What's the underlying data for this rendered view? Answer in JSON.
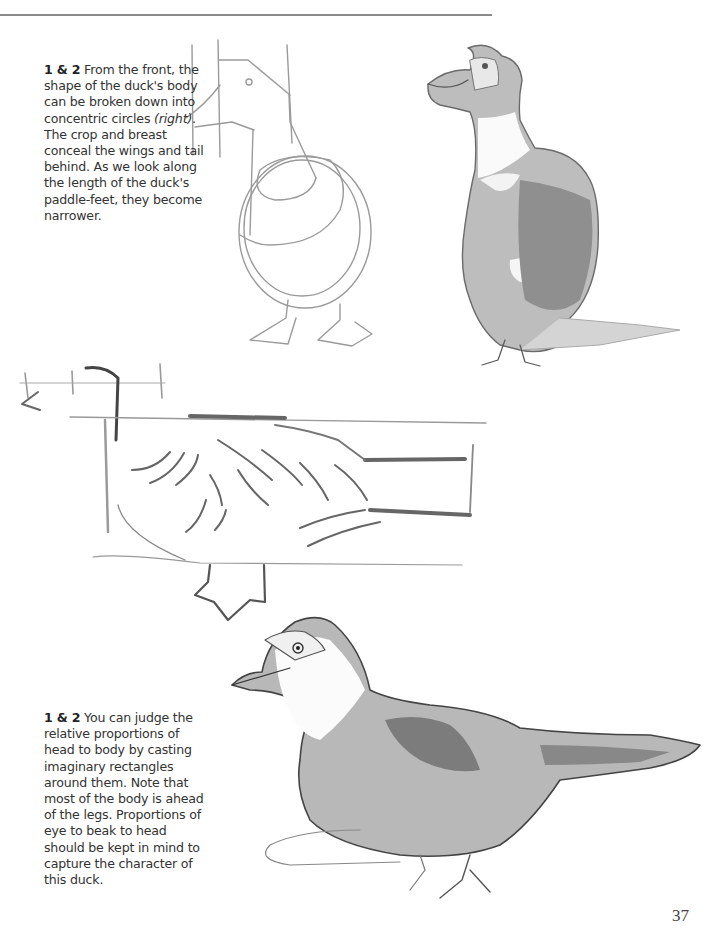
{
  "page": {
    "page_number": "37",
    "rule_color": "#8a8a8a"
  },
  "captions": [
    {
      "label": "1 & 2",
      "text_before_italic": " From the front, the shape of the duck's body can be broken down into concentric circles ",
      "italic": "(right)",
      "text_after_italic": ". The crop and breast conceal the wings and tail behind. As we look along the length of the duck's paddle-feet, they become narrower."
    },
    {
      "label": "1 & 2",
      "text": " You can judge the relative proportions of head to body by casting imaginary rectangles around them. Note that most of the body is ahead of the legs. Proportions of eye to beak to head should be kept in mind to capture the character of this duck."
    }
  ],
  "illustrations": [
    {
      "name": "front-construction-sketch",
      "description": "Front view of duck built from concentric circles and guide lines"
    },
    {
      "name": "front-finished-duck",
      "description": "Shaded pencil drawing of Muscovy duck, front view"
    },
    {
      "name": "side-rectangle-sketch",
      "description": "Side view of duck constructed with imaginary rectangles"
    },
    {
      "name": "side-finished-duck",
      "description": "Shaded pencil drawing of Muscovy duck, side view"
    }
  ]
}
